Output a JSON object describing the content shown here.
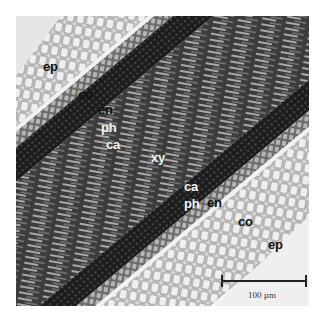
{
  "figure": {
    "type": "light micrograph, longitudinal section of plant root",
    "labels": [
      {
        "id": "ep-top",
        "text": "ep",
        "x": 43,
        "y": 60,
        "tone": "dark"
      },
      {
        "id": "co-top",
        "text": "co",
        "x": 78,
        "y": 88,
        "tone": "dark"
      },
      {
        "id": "en-top",
        "text": "en",
        "x": 98,
        "y": 103,
        "tone": "dark"
      },
      {
        "id": "ph-top",
        "text": "ph",
        "x": 101,
        "y": 121,
        "tone": "light"
      },
      {
        "id": "ca-top",
        "text": "ca",
        "x": 106,
        "y": 138,
        "tone": "light"
      },
      {
        "id": "xy",
        "text": "xy",
        "x": 151,
        "y": 151,
        "tone": "light"
      },
      {
        "id": "ca-bottom",
        "text": "ca",
        "x": 184,
        "y": 180,
        "tone": "light"
      },
      {
        "id": "ph-bottom",
        "text": "ph",
        "x": 184,
        "y": 197,
        "tone": "light"
      },
      {
        "id": "en-bottom",
        "text": "en",
        "x": 207,
        "y": 196,
        "tone": "dark"
      },
      {
        "id": "co-bottom",
        "text": "co",
        "x": 238,
        "y": 215,
        "tone": "dark"
      },
      {
        "id": "ep-bottom",
        "text": "ep",
        "x": 268,
        "y": 238,
        "tone": "dark"
      }
    ],
    "scale_bar": {
      "label": "100 µm"
    }
  }
}
